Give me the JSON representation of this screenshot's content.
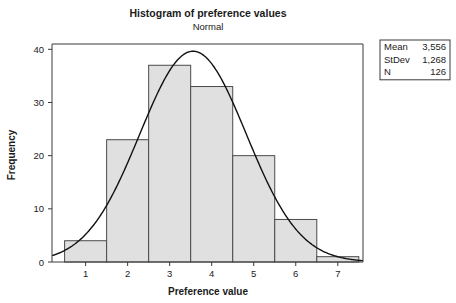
{
  "chart_data": {
    "type": "bar",
    "title": "Histogram of preference values",
    "subtitle": "Normal",
    "xlabel": "Preference value",
    "ylabel": "Frequency",
    "categories": [
      "1",
      "2",
      "3",
      "4",
      "5",
      "6",
      "7"
    ],
    "values": [
      4,
      23,
      37,
      33,
      20,
      8,
      1
    ],
    "bin_edges": [
      0.5,
      1.5,
      2.5,
      3.5,
      4.5,
      5.5,
      6.5,
      7.5
    ],
    "bin_width": 1,
    "xlim": [
      0.2,
      7.6
    ],
    "ylim": [
      0,
      41
    ],
    "xticks": [
      1,
      2,
      3,
      4,
      5,
      6,
      7
    ],
    "yticks": [
      0,
      10,
      20,
      30,
      40
    ],
    "xtick_labels": [
      "1",
      "2",
      "3",
      "4",
      "5",
      "6",
      "7"
    ],
    "ytick_labels": [
      "0",
      "10",
      "20",
      "30",
      "40"
    ],
    "grid": false,
    "legend_position": "top-right-outside",
    "bar_fill": "#e0e0e0",
    "bar_stroke": "#4a4a4a",
    "curve_color": "#111111",
    "overlay": {
      "type": "normal-density-curve",
      "mean": 3.556,
      "stdev": 1.268,
      "n": 126
    }
  },
  "legend": {
    "rows": [
      {
        "label": "Mean",
        "value": "3,556"
      },
      {
        "label": "StDev",
        "value": "1,268"
      },
      {
        "label": "N",
        "value": "126"
      }
    ]
  }
}
